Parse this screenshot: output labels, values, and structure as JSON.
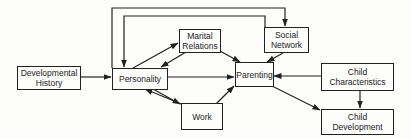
{
  "diagram": {
    "type": "flow-diagram",
    "nodes": {
      "developmental_history": {
        "label": "Developmental\nHistory"
      },
      "personality": {
        "label": "Personality"
      },
      "marital_relations": {
        "label": "Marital\nRelations"
      },
      "social_network": {
        "label": "Social\nNetwork"
      },
      "parenting": {
        "label": "Parenting"
      },
      "child_characteristics": {
        "label": "Child\nCharacteristics"
      },
      "work": {
        "label": "Work"
      },
      "child_development": {
        "label": "Child\nDevelopment"
      }
    },
    "edges": [
      {
        "from": "Developmental History",
        "to": "Personality"
      },
      {
        "from": "Personality",
        "to": "Parenting"
      },
      {
        "from": "Personality",
        "to": "Marital Relations"
      },
      {
        "from": "Marital Relations",
        "to": "Personality"
      },
      {
        "from": "Personality",
        "to": "Social Network"
      },
      {
        "from": "Social Network",
        "to": "Personality"
      },
      {
        "from": "Personality",
        "to": "Work"
      },
      {
        "from": "Work",
        "to": "Personality"
      },
      {
        "from": "Marital Relations",
        "to": "Parenting"
      },
      {
        "from": "Social Network",
        "to": "Parenting"
      },
      {
        "from": "Work",
        "to": "Parenting"
      },
      {
        "from": "Child Characteristics",
        "to": "Parenting"
      },
      {
        "from": "Child Characteristics",
        "to": "Child Development"
      },
      {
        "from": "Parenting",
        "to": "Child Development"
      }
    ]
  }
}
